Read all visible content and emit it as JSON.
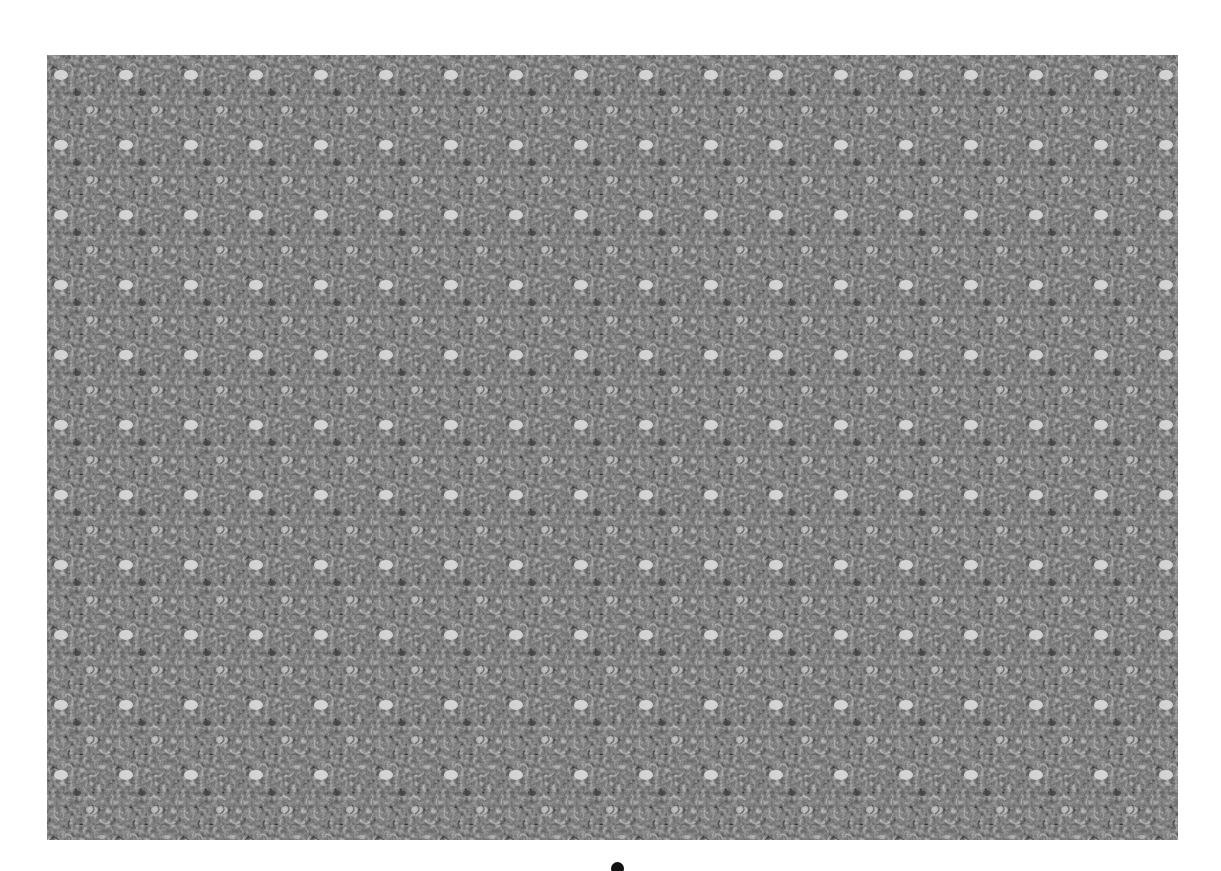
{
  "image": {
    "kind": "autostereogram",
    "texture": "grayscale-noise",
    "pattern_period_px": 65,
    "colors": {
      "background": "#ffffff",
      "texture_base": "#5a5a5a",
      "texture_dark": "#2e2e2e",
      "texture_light": "#d8d8d8",
      "marker": "#111111"
    }
  },
  "footer": {
    "marker": "dot-icon"
  }
}
